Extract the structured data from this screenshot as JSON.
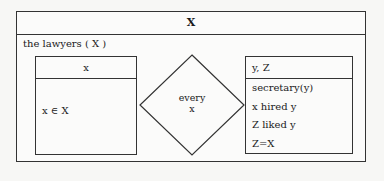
{
  "drs": {
    "title": "X",
    "restrictor_label": "the lawyers ( X )",
    "left_box": {
      "referent": "x",
      "conditions": [
        "x ∈ X"
      ]
    },
    "quantifier": {
      "word": "every",
      "variable": "x"
    },
    "right_box": {
      "referents": "y, Z",
      "conditions": [
        "secretary(y)",
        "x hired y",
        "Z liked y",
        "Z=X"
      ]
    }
  }
}
